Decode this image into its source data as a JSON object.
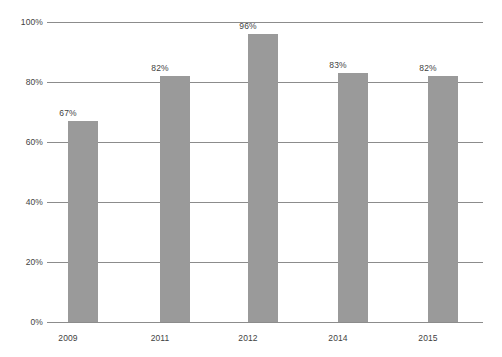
{
  "chart_data": {
    "type": "bar",
    "title": "",
    "subtitle": "",
    "xlabel": "",
    "ylabel": "",
    "categories": [
      "2009",
      "2011",
      "2012",
      "2014",
      "2015"
    ],
    "values": [
      67,
      82,
      96,
      83,
      82
    ],
    "value_labels": [
      "67%",
      "82%",
      "96%",
      "83%",
      "82%"
    ],
    "ylim": [
      0,
      100
    ],
    "ytick_values": [
      0,
      20,
      40,
      60,
      80,
      100
    ],
    "ytick_labels": [
      "0%",
      "20%",
      "40%",
      "60%",
      "80%",
      "100%"
    ],
    "grid": true,
    "legend": false,
    "legend_position": "none",
    "series": [
      {
        "name": "",
        "values": [
          67,
          82,
          96,
          83,
          82
        ]
      }
    ],
    "colors": {
      "bar_fill": "#9a9a9a",
      "gridline": "#8c8c8c",
      "text": "#3f3f3f",
      "background": "#ffffff"
    }
  },
  "caption": {
    "text": ""
  }
}
